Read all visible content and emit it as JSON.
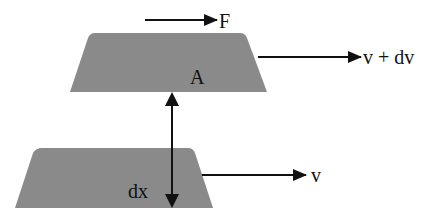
{
  "diagram": {
    "colors": {
      "plate": "#8a8a8a",
      "arrow": "#111111",
      "background": "#ffffff"
    },
    "top_plate": {
      "area_label": "A",
      "velocity_label": "v + dv",
      "force_label": "F"
    },
    "bottom_plate": {
      "velocity_label": "v"
    },
    "separation": {
      "label": "dx"
    }
  }
}
